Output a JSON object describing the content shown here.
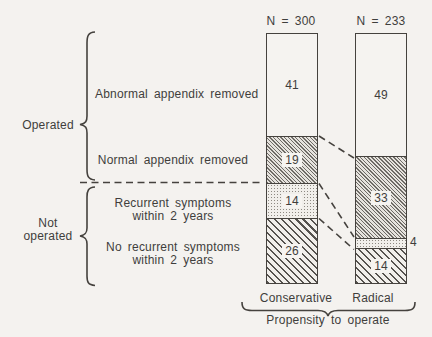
{
  "meta": {
    "background": "#f4f2ef",
    "ink": "#45423e"
  },
  "chart_data": {
    "type": "bar",
    "subtype": "100-percent-stacked-columns",
    "title": "",
    "columns": [
      "Conservative",
      "Radical"
    ],
    "column_n": [
      "N = 300",
      "N = 233"
    ],
    "x_group_label": "Propensity to operate",
    "ylim": [
      0,
      100
    ],
    "unit": "percent",
    "grid": false,
    "legend_position": "left-row-labels",
    "segments": [
      {
        "label": "Abnormal appendix removed",
        "group": "Operated",
        "pattern": "plain",
        "values": [
          41,
          49
        ]
      },
      {
        "label": "Normal appendix removed",
        "group": "Operated",
        "pattern": "fine-diagonal-hatch",
        "values": [
          19,
          33
        ]
      },
      {
        "label": "Recurrent symptoms within 2 years",
        "group": "Not operated",
        "pattern": "stipple-dots",
        "values": [
          14,
          4
        ]
      },
      {
        "label": "No recurrent symptoms within 2 years",
        "group": "Not operated",
        "pattern": "diagonal-hatch",
        "values": [
          26,
          14
        ]
      }
    ]
  },
  "side": {
    "operated": "Operated",
    "not_line1": "Not",
    "not_line2": "operated",
    "abnormal": "Abnormal appendix removed",
    "normal": "Normal appendix removed",
    "recurrent_line1": "Recurrent symptoms",
    "recurrent_line2": "within 2 years",
    "no_recurrent_line1": "No recurrent symptoms",
    "no_recurrent_line2": "within 2 years"
  },
  "axis": {
    "col1": "Conservative",
    "col2": "Radical",
    "group": "Propensity to operate"
  }
}
